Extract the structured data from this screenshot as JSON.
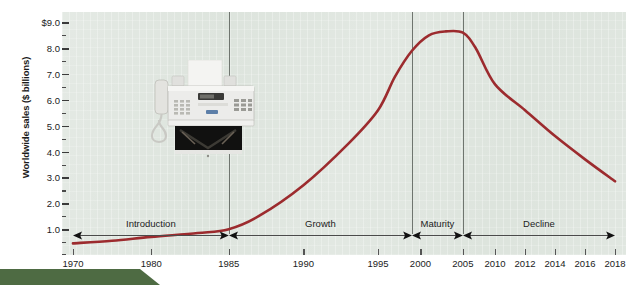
{
  "figure": {
    "background_color": "#ffffff",
    "plot_background_color": "#dde4dd",
    "curve_color": "#9c2b2e",
    "banner_color": "#4e6b43"
  },
  "axes": {
    "y_title": "Worldwide sales ($ billions)",
    "y_tick_labels": [
      "$9.0",
      "8.0",
      "7.0",
      "6.0",
      "5.0",
      "4.0",
      "3.0",
      "2.0",
      "1.0"
    ],
    "y_tick_values": [
      9.0,
      8.0,
      7.0,
      6.0,
      5.0,
      4.0,
      3.0,
      2.0,
      1.0
    ],
    "y_minor_step": 0.5,
    "y_min": 0.0,
    "y_max": 9.4,
    "x_tick_labels": [
      "1970",
      "1980",
      "1985",
      "1990",
      "1995",
      "2000",
      "2005",
      "2010",
      "2012",
      "2014",
      "2016",
      "2018"
    ],
    "x_tick_values": [
      1970,
      1980,
      1985,
      1990,
      1995,
      2000,
      2005,
      2010,
      2012,
      2014,
      2016,
      2018
    ],
    "x_tick_positions_px": [
      15,
      122,
      228,
      330,
      432,
      490,
      548,
      592,
      633,
      674,
      715,
      756
    ]
  },
  "stages": [
    {
      "name": "Introduction",
      "label": "Introduction",
      "start_year": 1970,
      "end_year": 1985
    },
    {
      "name": "Growth",
      "label": "Growth",
      "start_year": 1985,
      "end_year": 1999
    },
    {
      "name": "Maturity",
      "label": "Maturity",
      "start_year": 1999,
      "end_year": 2005
    },
    {
      "name": "Decline",
      "label": "Decline",
      "start_year": 2005,
      "end_year": 2018
    }
  ],
  "stage_dividers": [
    1985,
    1999,
    2005
  ],
  "product": {
    "icon_name": "fax-machine-photo",
    "description": "Fax machine"
  },
  "chart_data": {
    "type": "line",
    "title": "",
    "subtitle": "",
    "xlabel": "",
    "ylabel": "Worldwide sales ($ billions)",
    "xlim": [
      1970,
      2018
    ],
    "ylim": [
      0,
      9.4
    ],
    "grid": false,
    "legend": "none",
    "x_axis_scale": "piecewise (1970-2010 compressed, 2010-2018 expanded)",
    "series": [
      {
        "name": "Worldwide fax machine sales",
        "color": "#9c2b2e",
        "x": [
          1970,
          1975,
          1980,
          1983,
          1985,
          1987,
          1990,
          1993,
          1995,
          1997,
          1999,
          2001,
          2003,
          2005,
          2007,
          2010,
          2012,
          2014,
          2016,
          2018
        ],
        "y": [
          0.45,
          0.55,
          0.7,
          0.85,
          1.0,
          1.5,
          2.7,
          4.3,
          5.6,
          6.9,
          7.9,
          8.5,
          8.65,
          8.6,
          8.0,
          6.6,
          5.6,
          4.6,
          3.7,
          2.85
        ]
      }
    ],
    "annotations": [
      {
        "text": "Introduction",
        "stage_start": 1970,
        "stage_end": 1985
      },
      {
        "text": "Growth",
        "stage_start": 1985,
        "stage_end": 1999
      },
      {
        "text": "Maturity",
        "stage_start": 1999,
        "stage_end": 2005
      },
      {
        "text": "Decline",
        "stage_start": 2005,
        "stage_end": 2018
      }
    ]
  }
}
